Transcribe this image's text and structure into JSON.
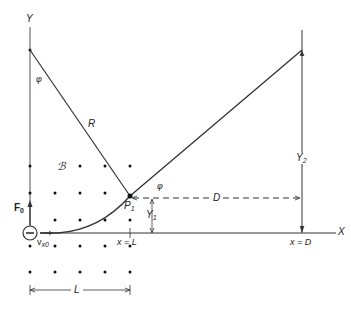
{
  "diagram": {
    "axes": {
      "y_label": "Y",
      "x_label": "X"
    },
    "labels": {
      "phi_top": "φ",
      "phi_exit": "φ",
      "radius": "R",
      "field": "ℬ",
      "force": "F",
      "force_sub": "0",
      "velocity": "v",
      "velocity_sub": "x0",
      "electron": "−",
      "point": "P",
      "point_sub": "1",
      "y1": "Y",
      "y1_sub": "1",
      "y2": "Y",
      "y2_sub": "2",
      "distance_d": "D",
      "x_eq_l": "x = L",
      "x_eq_d": "x = D",
      "length_l": "L"
    },
    "colors": {
      "line": "#333333",
      "dot": "#111111",
      "background": "#ffffff"
    }
  }
}
